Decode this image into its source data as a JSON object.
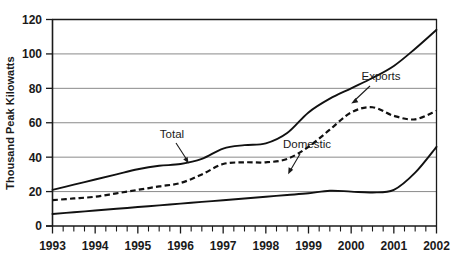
{
  "chart_data": {
    "type": "line",
    "title": "",
    "xlabel": "",
    "ylabel": "Thousand Peak Kilowatts",
    "xlim": [
      1993,
      2002
    ],
    "ylim": [
      0,
      120
    ],
    "ytick_labels": [
      "0",
      "20",
      "40",
      "60",
      "80",
      "100",
      "120"
    ],
    "ytick_values": [
      0,
      20,
      40,
      60,
      80,
      100,
      120
    ],
    "xtick_labels": [
      "1993",
      "1994",
      "1995",
      "1996",
      "1997",
      "1998",
      "1999",
      "2000",
      "2001",
      "2002"
    ],
    "xtick_values": [
      1993,
      1994,
      1995,
      1996,
      1997,
      1998,
      1999,
      2000,
      2001,
      2002
    ],
    "minor_ticks_per_year": 4,
    "grid": true,
    "legend_position": "inline-annotations",
    "x": [
      1993,
      1993.5,
      1994,
      1994.5,
      1995,
      1995.5,
      1996,
      1996.5,
      1997,
      1997.5,
      1998,
      1998.5,
      1999,
      1999.5,
      2000,
      2000.5,
      2001,
      2001.5,
      2002
    ],
    "series": [
      {
        "name": "Total",
        "style": "solid",
        "values": [
          21,
          24,
          27,
          30,
          33,
          35,
          36,
          39,
          45,
          47,
          48,
          54,
          66,
          74,
          80,
          86,
          93,
          103,
          114
        ]
      },
      {
        "name": "Exports",
        "style": "dashed",
        "values": [
          15,
          16,
          17,
          19,
          21,
          23,
          25,
          30,
          36,
          37,
          37,
          39,
          46,
          56,
          66,
          69,
          64,
          62,
          67
        ]
      },
      {
        "name": "Domestic",
        "style": "solid",
        "values": [
          7,
          8,
          9,
          10,
          11,
          12,
          13,
          14,
          15,
          16,
          17,
          18,
          19,
          20.5,
          20,
          19.5,
          21,
          31,
          46
        ]
      }
    ],
    "annotations": [
      {
        "label": "Total",
        "points_to": "total-series"
      },
      {
        "label": "Exports",
        "points_to": "exports-series"
      },
      {
        "label": "Domestic",
        "points_to": "domestic-series"
      }
    ],
    "colors": {
      "line": "#111111",
      "grid": "#8a8a8a",
      "axis": "#1a1a1a",
      "background": "#ffffff"
    }
  }
}
